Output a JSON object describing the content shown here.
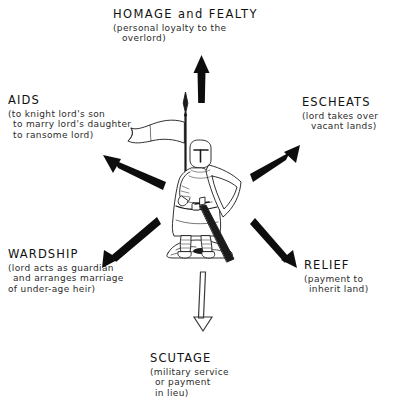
{
  "diagram": {
    "center_figure": "armoured knight standing with banner-spear, kite shield and sword",
    "background_color": "#ffffff",
    "ink_color": "#111111"
  },
  "nodes": [
    {
      "id": "homage",
      "title": "HOMAGE and FEALTY",
      "desc": [
        "(personal loyalty to the",
        "overlord)"
      ],
      "arrow": "up",
      "arrow_style": "solid"
    },
    {
      "id": "aids",
      "title": "AIDS",
      "desc": [
        "(to knight lord's son",
        "to marry lord's daughter",
        "to ransome lord)"
      ],
      "arrow": "up-left",
      "arrow_style": "solid"
    },
    {
      "id": "escheats",
      "title": "ESCHEATS",
      "desc": [
        "(lord takes over",
        "vacant lands)"
      ],
      "arrow": "up-right",
      "arrow_style": "solid"
    },
    {
      "id": "wardship",
      "title": "WARDSHIP",
      "desc": [
        "(lord acts as guardian",
        "and arranges marriage",
        "of under-age heir)"
      ],
      "arrow": "down-left",
      "arrow_style": "solid"
    },
    {
      "id": "relief",
      "title": "RELIEF",
      "desc": [
        "(payment to",
        "inherit land)"
      ],
      "arrow": "down-right",
      "arrow_style": "solid"
    },
    {
      "id": "scutage",
      "title": "SCUTAGE",
      "desc": [
        "(military service",
        "or payment",
        "in lieu)"
      ],
      "arrow": "down",
      "arrow_style": "outline"
    }
  ]
}
